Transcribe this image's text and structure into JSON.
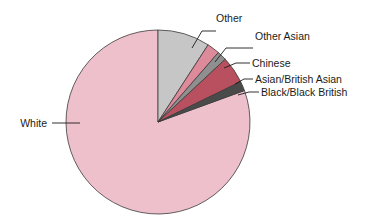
{
  "chart_data": {
    "type": "pie",
    "title": "",
    "subtitle": "",
    "xlabel": "",
    "ylabel": "",
    "legend_position": "none",
    "labels_position": "callout-leader-lines",
    "grid": false,
    "start_angle_deg": 0,
    "direction": "clockwise",
    "categories": [
      "Other",
      "Other Asian",
      "Chinese",
      "Asian/British Asian",
      "Black/Black British",
      "White"
    ],
    "values": [
      9.2,
      2.2,
      1.7,
      4.7,
      1.7,
      80.5
    ],
    "series": [
      {
        "name": "Ethnic group share",
        "values": [
          9.2,
          2.2,
          1.7,
          4.7,
          1.7,
          80.5
        ]
      }
    ],
    "slices": [
      {
        "label": "Other",
        "value": 9.2,
        "start_angle_deg": 0,
        "end_angle_deg": 33,
        "color": "#c6c6c6"
      },
      {
        "label": "Other Asian",
        "value": 2.2,
        "start_angle_deg": 33,
        "end_angle_deg": 41,
        "color": "#dd8a9a"
      },
      {
        "label": "Chinese",
        "value": 1.7,
        "start_angle_deg": 41,
        "end_angle_deg": 47,
        "color": "#8f8f8f"
      },
      {
        "label": "Asian/British Asian",
        "value": 4.7,
        "start_angle_deg": 47,
        "end_angle_deg": 64,
        "color": "#b8505f"
      },
      {
        "label": "Black/Black British",
        "value": 1.7,
        "start_angle_deg": 64,
        "end_angle_deg": 70,
        "color": "#4a4a4a"
      },
      {
        "label": "White",
        "value": 80.5,
        "start_angle_deg": 70,
        "end_angle_deg": 360,
        "color": "#eec0cc"
      }
    ],
    "colors": {
      "other": "#c6c6c6",
      "other_asian": "#dd8a9a",
      "chinese": "#8f8f8f",
      "asian_british_asian": "#b8505f",
      "black_black_british": "#4a4a4a",
      "white": "#eec0cc",
      "outline": "#3a3a3a",
      "label_text": "#1b1b1b",
      "background": "#ffffff"
    }
  },
  "labels": {
    "other": "Other",
    "other_asian": "Other Asian",
    "chinese": "Chinese",
    "asian_british_asian": "Asian/British Asian",
    "black_black_british": "Black/Black British",
    "white": "White"
  }
}
